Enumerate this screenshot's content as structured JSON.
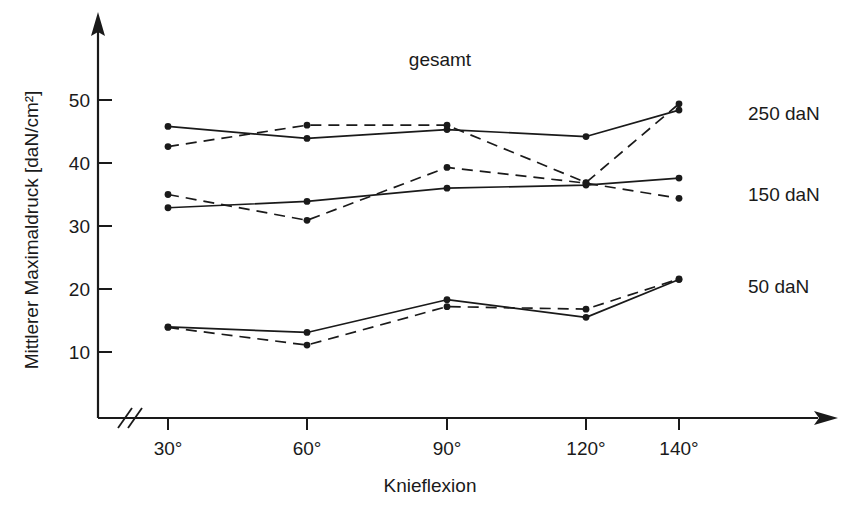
{
  "chart_data": {
    "type": "line",
    "title": "gesamt",
    "xlabel": "Knieflexion",
    "ylabel": "Mittlerer Maximaldruck [daN/cm²]",
    "categories": [
      "30°",
      "60°",
      "90°",
      "120°",
      "140°"
    ],
    "x_values": [
      30,
      60,
      90,
      120,
      140
    ],
    "xtick_labels": [
      "30°",
      "60°",
      "90°",
      "120°",
      "140°"
    ],
    "ytick_labels": [
      "10",
      "20",
      "30",
      "40",
      "50"
    ],
    "ytick_values": [
      10,
      20,
      30,
      40,
      50
    ],
    "ylim": [
      0,
      57
    ],
    "grid": false,
    "axis_break_x": true,
    "axis_arrows": true,
    "legend_position": "right-inline",
    "line_color": "#1a1a1a",
    "background": "#ffffff",
    "groups": [
      {
        "label": "250 daN",
        "label_value": 250,
        "label_y": 49.5,
        "series": [
          {
            "name": "250 daN solid",
            "style": "solid",
            "values": [
              45.8,
              43.9,
              45.3,
              44.2,
              48.4
            ]
          },
          {
            "name": "250 daN dashed",
            "style": "dashed",
            "values": [
              42.6,
              46.0,
              46.0,
              36.9,
              49.4
            ]
          }
        ]
      },
      {
        "label": "150 daN",
        "label_value": 150,
        "label_y": 36.2,
        "series": [
          {
            "name": "150 daN solid",
            "style": "solid",
            "values": [
              32.9,
              33.9,
              36.0,
              36.5,
              37.6
            ]
          },
          {
            "name": "150 daN dashed",
            "style": "dashed",
            "values": [
              35.0,
              30.9,
              39.3,
              36.8,
              34.4
            ]
          }
        ]
      },
      {
        "label": "50 daN",
        "label_value": 50,
        "label_y": 22.5,
        "series": [
          {
            "name": "50 daN solid",
            "style": "solid",
            "values": [
              14.0,
              13.1,
              18.3,
              15.5,
              21.5
            ]
          },
          {
            "name": "50 daN dashed",
            "style": "dashed",
            "values": [
              13.9,
              11.1,
              17.2,
              16.8,
              21.6
            ]
          }
        ]
      }
    ]
  },
  "labels": {
    "title": "gesamt",
    "xlabel": "Knieflexion",
    "ylabel": "Mittlerer Maximaldruck [daN/cm²]",
    "series_250": "250 daN",
    "series_150": "150 daN",
    "series_50": "50 daN",
    "ytick_50": "50",
    "ytick_40": "40",
    "ytick_30": "30",
    "ytick_20": "20",
    "ytick_10": "10",
    "xtick_30": "30°",
    "xtick_60": "60°",
    "xtick_90": "90°",
    "xtick_120": "120°",
    "xtick_140": "140°"
  }
}
